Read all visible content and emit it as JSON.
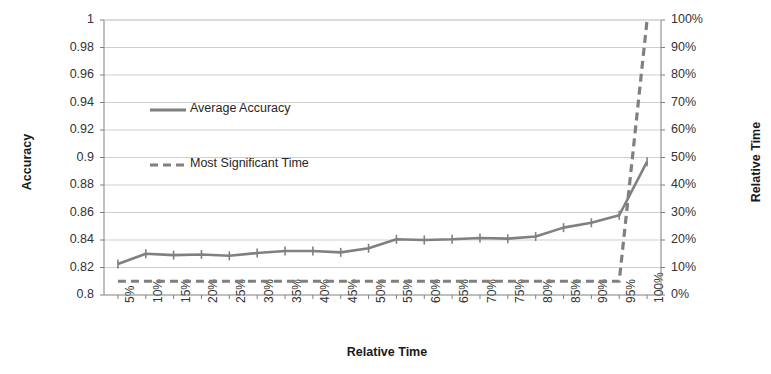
{
  "chart_data": {
    "type": "line",
    "title": "",
    "xlabel": "Relative Time",
    "ylabel": "Accuracy",
    "y2label": "Relative Time",
    "grid": true,
    "legend_position": "inside-upper-left",
    "categories": [
      "5%",
      "10%",
      "15%",
      "20%",
      "25%",
      "30%",
      "35%",
      "40%",
      "45%",
      "50%",
      "55%",
      "60%",
      "65%",
      "70%",
      "75%",
      "80%",
      "85%",
      "90%",
      "95%",
      "100%"
    ],
    "ylim": [
      0.8,
      1
    ],
    "yticks": [
      "0.8",
      "0.82",
      "0.84",
      "0.86",
      "0.88",
      "0.9",
      "0.92",
      "0.94",
      "0.96",
      "0.98",
      "1"
    ],
    "y2lim": [
      0,
      100
    ],
    "y2ticks": [
      "0%",
      "10%",
      "20%",
      "30%",
      "40%",
      "50%",
      "60%",
      "70%",
      "80%",
      "90%",
      "100%"
    ],
    "series": [
      {
        "name": "Average Accuracy",
        "axis": "left",
        "style": "solid",
        "color": "#808080",
        "marker": "tick",
        "values": [
          0.8225,
          0.83,
          0.829,
          0.8295,
          0.8285,
          0.8305,
          0.832,
          0.832,
          0.831,
          0.834,
          0.8405,
          0.84,
          0.8405,
          0.8415,
          0.841,
          0.8425,
          0.849,
          0.8525,
          0.858,
          0.897
        ]
      },
      {
        "name": "Most Significant Time",
        "axis": "right",
        "style": "dashed",
        "color": "#808080",
        "marker": "none",
        "values": [
          5,
          5,
          5,
          5,
          5,
          5,
          5,
          5,
          5,
          5,
          5,
          5,
          5,
          5,
          5,
          5,
          5,
          5,
          5,
          100
        ]
      }
    ]
  },
  "legend": {
    "items": [
      {
        "label": "Average Accuracy",
        "style": "solid",
        "color": "#808080"
      },
      {
        "label": "Most Significant Time",
        "style": "dashed",
        "color": "#808080"
      }
    ]
  },
  "colors": {
    "series_gray": "#808080",
    "grid": "#cfcfcf",
    "axis": "#808080",
    "text": "#333333",
    "title_text": "#1a1a1a",
    "background": "#ffffff"
  }
}
